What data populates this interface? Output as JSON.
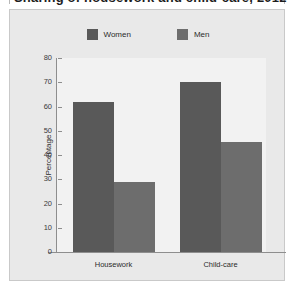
{
  "figure": {
    "title": "Sharing of housework and child-care, 2012",
    "panel_bg": "#e9e9e9",
    "plot_bg": "#f2f2f2",
    "axis_color": "#8e8e8e"
  },
  "legend": {
    "position": "top-center",
    "entries": [
      {
        "label": "Women",
        "color": "#595959"
      },
      {
        "label": "Men",
        "color": "#6d6d6d"
      }
    ]
  },
  "chart_data": {
    "type": "bar",
    "title": "Sharing of housework and child-care, 2012",
    "categories": [
      "Housework",
      "Child-care"
    ],
    "series": [
      {
        "name": "Women",
        "values": [
          62,
          70
        ],
        "color": "#595959"
      },
      {
        "name": "Men",
        "values": [
          29,
          45.5
        ],
        "color": "#6d6d6d"
      }
    ],
    "xlabel": "",
    "ylabel": "Percentage",
    "ylim": [
      0,
      80
    ],
    "yticks": [
      0,
      10,
      20,
      30,
      40,
      50,
      60,
      70,
      80
    ],
    "ytick_labels": [
      "0",
      "10",
      "20",
      "30",
      "40",
      "50",
      "60",
      "70",
      "80"
    ],
    "grid": false,
    "legend_position": "top-center"
  }
}
